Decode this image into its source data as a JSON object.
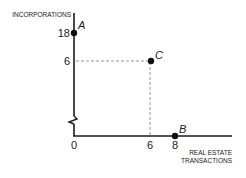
{
  "diagram": {
    "y_axis_title": "INCORPORATIONS",
    "x_axis_title_line1": "REAL ESTATE",
    "x_axis_title_line2": "TRANSACTIONS",
    "origin_label": "0",
    "y_ticks": [
      "18",
      "6"
    ],
    "x_ticks": [
      "6",
      "8"
    ],
    "points": [
      {
        "label": "A",
        "x": 0,
        "y": 18
      },
      {
        "label": "B",
        "x": 8,
        "y": 0
      },
      {
        "label": "C",
        "x": 6,
        "y": 6
      }
    ],
    "axis_break": true,
    "colors": {
      "axis": "#1a1a1a",
      "dashed": "#888888",
      "point": "#111111"
    }
  }
}
